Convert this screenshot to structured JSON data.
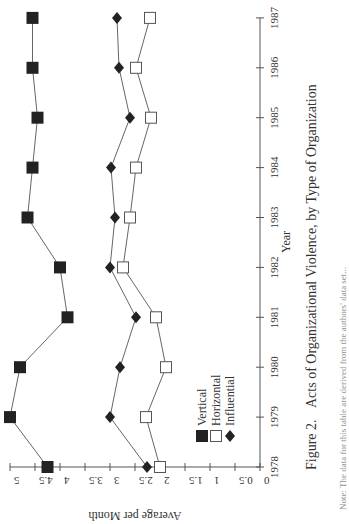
{
  "figure": {
    "label": "Figure 2.",
    "caption": "Acts of Organizational Violence, by Type of Organization",
    "note_partial": "Note: The data for this table are derived from the authors' data set..."
  },
  "chart_data": {
    "type": "line",
    "title": "Acts of Organizational Violence, by Type of Organization",
    "xlabel": "Year",
    "ylabel": "Average per Month",
    "x": [
      1978,
      1979,
      1980,
      1981,
      1982,
      1983,
      1984,
      1985,
      1986,
      1987
    ],
    "ylim": [
      0,
      5
    ],
    "yticks": [
      "0",
      "0.5",
      "1",
      "1.5",
      "2",
      "2.5",
      "3",
      "3.5",
      "4",
      "4.5",
      "5"
    ],
    "xticks": [
      "1978",
      "1979",
      "1980",
      "1981",
      "1982",
      "1983",
      "1984",
      "1985",
      "1986",
      "1987"
    ],
    "grid": false,
    "legend_position": "inside lower-left (near 1979-1980, values 0.5-1.5)",
    "orientation": "rotated 90 degrees counter-clockwise on page",
    "series": [
      {
        "name": "Vertical",
        "marker": "filled-square",
        "values": [
          4.25,
          5.0,
          4.8,
          3.85,
          4.0,
          4.65,
          4.55,
          4.45,
          4.55,
          4.55
        ]
      },
      {
        "name": "Horizontal",
        "marker": "open-square",
        "values": [
          2.0,
          2.28,
          1.88,
          2.08,
          2.74,
          2.6,
          2.48,
          2.18,
          2.48,
          2.2
        ]
      },
      {
        "name": "Influential",
        "marker": "filled-diamond",
        "values": [
          2.26,
          3.0,
          2.8,
          2.48,
          3.0,
          2.9,
          2.98,
          2.6,
          2.82,
          2.86
        ]
      }
    ],
    "legend": [
      "Vertical",
      "Horizontal",
      "Influential"
    ]
  },
  "colors": {
    "ink": "#222222",
    "axis": "#555555",
    "line": "#666666"
  }
}
